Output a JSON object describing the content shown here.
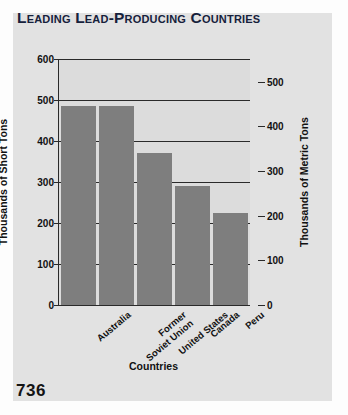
{
  "page": {
    "number": "736",
    "panel_color": "#e2e2e2",
    "plot_bg_color": "#dcdcdc",
    "bar_color": "#7e7e7e",
    "title_color": "#16213c",
    "axis_color": "#2a2a2a"
  },
  "chart_data": {
    "type": "bar",
    "title": "Leading Lead-Producing Countries",
    "categories": [
      "Australia",
      "Former\nSoviet Union",
      "United States",
      "Canada",
      "Peru"
    ],
    "category_labels": [
      {
        "line1": "Australia",
        "line2": ""
      },
      {
        "line1": "Former",
        "line2": "Soviet Union"
      },
      {
        "line1": "United States",
        "line2": ""
      },
      {
        "line1": "Canada",
        "line2": ""
      },
      {
        "line1": "Peru",
        "line2": ""
      }
    ],
    "values": [
      485,
      485,
      370,
      290,
      225
    ],
    "xlabel": "Countries",
    "ylabel": "Thousands of Short Tons",
    "ylabel_right": "Thousands of Metric Tons",
    "ylim": [
      0,
      600
    ],
    "yticks": [
      0,
      100,
      200,
      300,
      400,
      500,
      600
    ],
    "ylim_right": [
      0,
      551
    ],
    "yticks_right": [
      0,
      100,
      200,
      300,
      400,
      500
    ],
    "unit_left": "thousands of short tons",
    "unit_right": "thousands of metric tons",
    "grid": true,
    "legend": "none",
    "series": [
      {
        "name": "Lead production",
        "values_short_tons": [
          485,
          485,
          370,
          290,
          225
        ],
        "values_metric_tons": [
          440,
          440,
          336,
          263,
          204
        ]
      }
    ]
  }
}
